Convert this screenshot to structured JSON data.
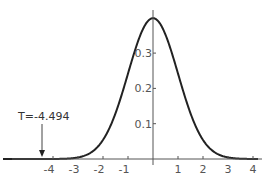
{
  "chart_data": {
    "type": "line",
    "title": "",
    "xlabel": "",
    "ylabel": "",
    "series": [
      {
        "name": "standard normal pdf",
        "x": [
          -5.5,
          -5,
          -4.5,
          -4,
          -3.5,
          -3,
          -2.5,
          -2,
          -1.5,
          -1,
          -0.5,
          0,
          0.5,
          1,
          1.5,
          2,
          2.5,
          3,
          3.5,
          4
        ],
        "values": [
          0.0,
          0.0,
          0.0,
          0.0001,
          0.0009,
          0.0044,
          0.0175,
          0.054,
          0.1295,
          0.242,
          0.3521,
          0.3989,
          0.3521,
          0.242,
          0.1295,
          0.054,
          0.0175,
          0.0044,
          0.0009,
          0.0001
        ]
      }
    ],
    "xticks": [
      "-4",
      "-3",
      "-2",
      "-1",
      "1",
      "2",
      "3",
      "4"
    ],
    "xtick_values": [
      -4,
      -3,
      -2,
      -1,
      1,
      2,
      3,
      4
    ],
    "yticks": [
      "0.1",
      "0.2",
      "0.3"
    ],
    "ytick_values": [
      0.1,
      0.2,
      0.3
    ],
    "xlim": [
      -6,
      4.2
    ],
    "ylim": [
      0,
      0.42
    ],
    "grid": false,
    "legend": null,
    "annotations": [
      {
        "text": "T=-4.494",
        "x": -4.494,
        "arrow": "down"
      }
    ]
  },
  "annotation_label": "T=-4.494",
  "colors": {
    "curve": "#222222",
    "axis": "#555555",
    "text": "#555555"
  }
}
